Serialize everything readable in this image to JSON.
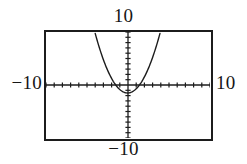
{
  "figure": {
    "kind": "graphing-calculator-viewing-window",
    "background_color": "#ffffff",
    "frame_color": "#1c1c1c",
    "curve_color": "#1c1c1c",
    "axis_color": "#1c1c1c"
  },
  "labels": {
    "top": "10",
    "bottom": "−10",
    "left": "−10",
    "right": "10"
  },
  "chart_data": {
    "type": "line",
    "title": "",
    "xlabel": "",
    "ylabel": "",
    "xlim": [
      -10,
      10
    ],
    "ylim": [
      -10,
      10
    ],
    "xtick_step": 1,
    "ytick_step": 1,
    "grid": false,
    "legend": null,
    "tick_style": "dotted-ticks-on-axes",
    "axis_labels_shown": {
      "xmin": "−10",
      "xmax": "10",
      "ymin": "−10",
      "ymax": "10"
    },
    "series": [
      {
        "name": "parabola",
        "shape": "upward-opening parabola",
        "vertex": [
          -0.05,
          -1.5
        ],
        "roots": [
          -1.5,
          1.4
        ],
        "leading_coefficient": 0.72,
        "x": [
          -3.2,
          -3.0,
          -2.75,
          -2.5,
          -2.25,
          -2.0,
          -1.75,
          -1.5,
          -1.25,
          -1.0,
          -0.75,
          -0.5,
          -0.25,
          0.0,
          0.25,
          0.5,
          0.75,
          1.0,
          1.25,
          1.5,
          1.75,
          2.0,
          2.25,
          2.5,
          2.75,
          3.0,
          3.2
        ],
        "y": [
          5.9,
          5.0,
          4.0,
          3.0,
          2.2,
          1.4,
          0.7,
          0.1,
          -0.4,
          -0.8,
          -1.1,
          -1.35,
          -1.47,
          -1.5,
          -1.47,
          -1.35,
          -1.1,
          -0.8,
          -0.4,
          0.1,
          0.7,
          1.4,
          2.2,
          3.0,
          4.0,
          5.0,
          5.9
        ]
      }
    ]
  }
}
